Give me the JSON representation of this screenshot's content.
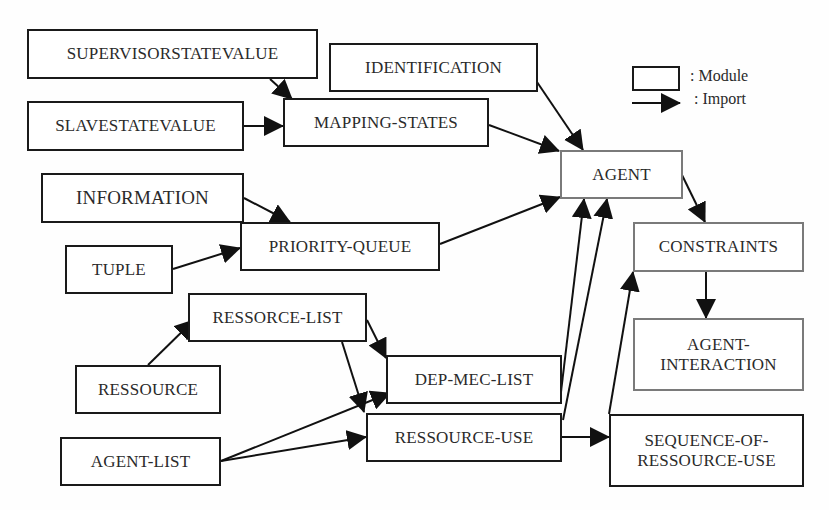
{
  "diagram": {
    "legend": {
      "module_label": ": Module",
      "import_label": ": Import"
    },
    "nodes": [
      {
        "id": "supervisorstatevalue",
        "label": "SUPERVISORSTATEVALUE",
        "x": 27,
        "y": 29,
        "w": 291,
        "h": 50,
        "style": "black"
      },
      {
        "id": "slavestatevalue",
        "label": "SLAVESTATEVALUE",
        "x": 27,
        "y": 101,
        "w": 217,
        "h": 50,
        "style": "black"
      },
      {
        "id": "identification",
        "label": "IDENTIFICATION",
        "x": 329,
        "y": 43,
        "w": 209,
        "h": 49,
        "style": "black"
      },
      {
        "id": "mapping-states",
        "label": "MAPPING-STATES",
        "x": 283,
        "y": 98,
        "w": 206,
        "h": 49,
        "style": "black"
      },
      {
        "id": "agent",
        "label": "AGENT",
        "x": 560,
        "y": 150,
        "w": 123,
        "h": 49,
        "style": "gray"
      },
      {
        "id": "information",
        "label": "INFORMATION",
        "x": 41,
        "y": 173,
        "w": 203,
        "h": 50,
        "style": "black",
        "big": true
      },
      {
        "id": "tuple",
        "label": "TUPLE",
        "x": 65,
        "y": 245,
        "w": 108,
        "h": 49,
        "style": "black"
      },
      {
        "id": "priority-queue",
        "label": "PRIORITY-QUEUE",
        "x": 240,
        "y": 222,
        "w": 200,
        "h": 49,
        "style": "black"
      },
      {
        "id": "constraints",
        "label": "CONSTRAINTS",
        "x": 633,
        "y": 222,
        "w": 171,
        "h": 50,
        "style": "gray"
      },
      {
        "id": "ressorce-list",
        "label": "RESSORCE-LIST",
        "x": 188,
        "y": 293,
        "w": 179,
        "h": 49,
        "style": "black"
      },
      {
        "id": "agent-interaction",
        "label": "AGENT-\nINTERACTION",
        "x": 633,
        "y": 318,
        "w": 171,
        "h": 73,
        "style": "gray"
      },
      {
        "id": "dep-mec-list",
        "label": "DEP-MEC-LIST",
        "x": 386,
        "y": 355,
        "w": 176,
        "h": 49,
        "style": "black"
      },
      {
        "id": "ressource",
        "label": "RESSOURCE",
        "x": 75,
        "y": 365,
        "w": 146,
        "h": 49,
        "style": "black"
      },
      {
        "id": "ressource-use",
        "label": "RESSOURCE-USE",
        "x": 366,
        "y": 413,
        "w": 196,
        "h": 49,
        "style": "black"
      },
      {
        "id": "agent-list",
        "label": "AGENT-LIST",
        "x": 60,
        "y": 437,
        "w": 161,
        "h": 49,
        "style": "black"
      },
      {
        "id": "sequence-of-ressource-use",
        "label": "SEQUENCE-OF-\nRESSOURCE-USE",
        "x": 609,
        "y": 414,
        "w": 195,
        "h": 73,
        "style": "black"
      }
    ],
    "edges": [
      {
        "from": "supervisorstatevalue",
        "to": "mapping-states",
        "x1": 270,
        "y1": 79,
        "x2": 292,
        "y2": 99
      },
      {
        "from": "slavestatevalue",
        "to": "mapping-states",
        "x1": 244,
        "y1": 126,
        "x2": 283,
        "y2": 126
      },
      {
        "from": "identification",
        "to": "agent",
        "x1": 537,
        "y1": 82,
        "x2": 583,
        "y2": 150
      },
      {
        "from": "mapping-states",
        "to": "agent",
        "x1": 489,
        "y1": 125,
        "x2": 559,
        "y2": 151
      },
      {
        "from": "information",
        "to": "priority-queue",
        "x1": 244,
        "y1": 198,
        "x2": 290,
        "y2": 222
      },
      {
        "from": "tuple",
        "to": "priority-queue",
        "x1": 173,
        "y1": 269,
        "x2": 240,
        "y2": 248
      },
      {
        "from": "priority-queue",
        "to": "agent",
        "x1": 440,
        "y1": 244,
        "x2": 560,
        "y2": 197
      },
      {
        "from": "agent",
        "to": "constraints",
        "x1": 682,
        "y1": 175,
        "x2": 705,
        "y2": 222
      },
      {
        "from": "constraints",
        "to": "agent-interaction",
        "x1": 706,
        "y1": 272,
        "x2": 706,
        "y2": 318
      },
      {
        "from": "ressource",
        "to": "ressorce-list",
        "x1": 148,
        "y1": 365,
        "x2": 194,
        "y2": 320
      },
      {
        "from": "ressorce-list",
        "to": "dep-mec-list",
        "x1": 367,
        "y1": 320,
        "x2": 386,
        "y2": 358
      },
      {
        "from": "ressorce-list",
        "to": "ressource-use",
        "x1": 342,
        "y1": 342,
        "x2": 364,
        "y2": 412
      },
      {
        "from": "agent-list",
        "to": "dep-mec-list",
        "x1": 221,
        "y1": 461,
        "x2": 390,
        "y2": 393
      },
      {
        "from": "agent-list",
        "to": "ressource-use",
        "x1": 221,
        "y1": 461,
        "x2": 366,
        "y2": 437
      },
      {
        "from": "dep-mec-list",
        "to": "agent",
        "x1": 561,
        "y1": 392,
        "x2": 584,
        "y2": 199
      },
      {
        "from": "ressource-use",
        "to": "agent",
        "x1": 563,
        "y1": 420,
        "x2": 607,
        "y2": 199
      },
      {
        "from": "ressource-use",
        "to": "sequence-of-ressource-use",
        "x1": 562,
        "y1": 437,
        "x2": 609,
        "y2": 437
      },
      {
        "from": "sequence-of-ressource-use",
        "to": "constraints",
        "x1": 609,
        "y1": 414,
        "x2": 633,
        "y2": 272
      }
    ]
  }
}
